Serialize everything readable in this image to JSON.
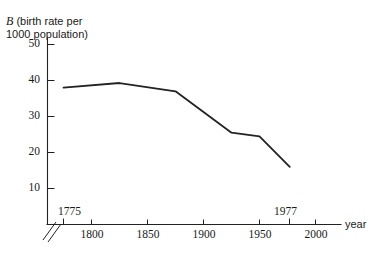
{
  "chart_data": {
    "type": "line",
    "title": "B (birth rate per 1000 population)",
    "title_symbol": "B",
    "title_rest": " (birth rate per\n1000 population)",
    "xlabel": "year",
    "ylabel": "B (birth rate per 1000 population)",
    "x": [
      1775,
      1825,
      1875,
      1925,
      1950,
      1977
    ],
    "values": [
      38,
      39.3,
      37,
      25.5,
      24.5,
      16
    ],
    "series": [
      {
        "name": "birth rate",
        "points": [
          {
            "x": 1775,
            "y": 38
          },
          {
            "x": 1825,
            "y": 39.3
          },
          {
            "x": 1875,
            "y": 37
          },
          {
            "x": 1925,
            "y": 25.5
          },
          {
            "x": 1950,
            "y": 24.5
          },
          {
            "x": 1977,
            "y": 16
          }
        ]
      }
    ],
    "xlim": [
      1762,
      2022
    ],
    "ylim": [
      0,
      54
    ],
    "x_ticks": [
      1775,
      1800,
      1850,
      1900,
      1950,
      1977,
      2000
    ],
    "x_tick_labels_below": [
      "1800",
      "1850",
      "1900",
      "1950",
      "2000"
    ],
    "x_tick_labels_above": [
      "1775",
      "1977"
    ],
    "y_ticks": [
      10,
      20,
      30,
      40,
      50
    ],
    "y_tick_labels": [
      "50",
      "40",
      "30",
      "20",
      "10"
    ],
    "grid": false,
    "legend": "none",
    "axis_break": true,
    "line_color": "#232323",
    "axis_color": "#222222"
  },
  "axis_labels": {
    "y": [
      "50",
      "40",
      "30",
      "20",
      "10"
    ],
    "x_below": [
      "1800",
      "1850",
      "1900",
      "1950",
      "2000"
    ],
    "x_start": "1775",
    "x_end": "1977",
    "x_name": "year"
  }
}
